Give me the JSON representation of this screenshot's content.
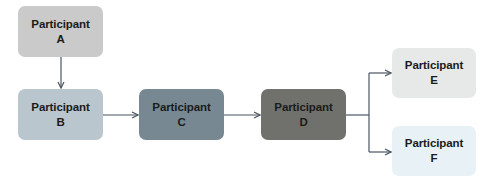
{
  "diagram": {
    "type": "flowchart",
    "nodes": [
      {
        "id": "A",
        "title": "Participant",
        "letter": "A",
        "fill": "#c9cac9",
        "x": 18,
        "y": 6,
        "w": 85,
        "h": 51
      },
      {
        "id": "B",
        "title": "Participant",
        "letter": "B",
        "fill": "#bac6cd",
        "x": 18,
        "y": 89,
        "w": 85,
        "h": 51
      },
      {
        "id": "C",
        "title": "Participant",
        "letter": "C",
        "fill": "#788893",
        "x": 139,
        "y": 89,
        "w": 85,
        "h": 51
      },
      {
        "id": "D",
        "title": "Participant",
        "letter": "D",
        "fill": "#70706c",
        "x": 261,
        "y": 89,
        "w": 85,
        "h": 51
      },
      {
        "id": "E",
        "title": "Participant",
        "letter": "E",
        "fill": "#e7e9e8",
        "x": 392,
        "y": 48,
        "w": 84,
        "h": 50
      },
      {
        "id": "F",
        "title": "Participant",
        "letter": "F",
        "fill": "#e8f2f6",
        "x": 392,
        "y": 126,
        "w": 84,
        "h": 50
      }
    ],
    "edges": [
      {
        "from": "A",
        "to": "B"
      },
      {
        "from": "B",
        "to": "C"
      },
      {
        "from": "C",
        "to": "D"
      },
      {
        "from": "D",
        "to": "E"
      },
      {
        "from": "D",
        "to": "F"
      }
    ],
    "line_color": "#4a5561"
  }
}
